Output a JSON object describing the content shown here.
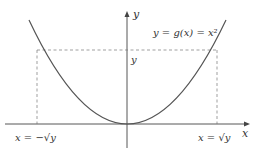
{
  "diagram": {
    "function_label": "y = g(x) = x²",
    "axis_x_label": "x",
    "axis_y_label": "y",
    "level_label": "y",
    "left_root_label": "x = −√y",
    "right_root_label": "x = √y",
    "colors": {
      "curve": "#555555",
      "axis": "#444444",
      "dashed": "#777777",
      "text": "#333333"
    }
  }
}
